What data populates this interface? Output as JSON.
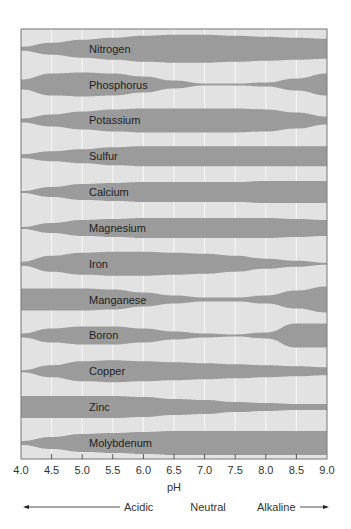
{
  "chart_data": {
    "type": "area",
    "title": "",
    "xlabel": "pH",
    "ylabel": "",
    "xlim": [
      4.0,
      9.0
    ],
    "x_ticks": [
      "4.0",
      "4.5",
      "5.0",
      "5.5",
      "6.0",
      "6.5",
      "7.0",
      "7.5",
      "8.0",
      "8.5",
      "9.0"
    ],
    "grid": true,
    "annotations": {
      "acidic": "Acidic",
      "neutral": "Neutral",
      "alkaline": "Alkaline"
    },
    "colors": {
      "background": "#e2e2e2",
      "band": "#9b9b9b",
      "grid": "#f4f4f4",
      "frame": "#777777"
    },
    "x": [
      4.0,
      4.5,
      5.0,
      5.5,
      6.0,
      6.5,
      7.0,
      7.5,
      8.0,
      8.5,
      9.0
    ],
    "series": [
      {
        "name": "Nitrogen",
        "values": [
          2,
          6,
          9,
          11,
          13,
          14,
          14,
          13,
          12,
          11,
          10
        ]
      },
      {
        "name": "Phosphorus",
        "values": [
          5,
          11,
          12,
          11,
          8,
          4,
          1,
          1,
          2,
          6,
          11
        ]
      },
      {
        "name": "Potassium",
        "values": [
          2,
          6,
          9,
          11,
          12,
          12,
          12,
          12,
          11,
          8,
          4
        ]
      },
      {
        "name": "Sulfur",
        "values": [
          2,
          5,
          7,
          9,
          10,
          10,
          10,
          10,
          10,
          10,
          10
        ]
      },
      {
        "name": "Calcium",
        "values": [
          1,
          5,
          8,
          9,
          10,
          10,
          10,
          10,
          11,
          11,
          11
        ]
      },
      {
        "name": "Magnesium",
        "values": [
          1,
          5,
          8,
          9,
          10,
          10,
          10,
          10,
          10,
          9,
          8
        ]
      },
      {
        "name": "Iron",
        "values": [
          2,
          8,
          11,
          12,
          12,
          11,
          10,
          8,
          5,
          3,
          1
        ]
      },
      {
        "name": "Manganese",
        "values": [
          11,
          11,
          11,
          10,
          7,
          4,
          2,
          2,
          4,
          9,
          13
        ]
      },
      {
        "name": "Boron",
        "values": [
          2,
          7,
          9,
          9,
          7,
          4,
          2,
          1,
          3,
          12,
          12
        ]
      },
      {
        "name": "Copper",
        "values": [
          1,
          6,
          10,
          11,
          10,
          9,
          8,
          7,
          6,
          5,
          4
        ]
      },
      {
        "name": "Zinc",
        "values": [
          11,
          11,
          11,
          11,
          10,
          8,
          7,
          5,
          4,
          3,
          3
        ]
      },
      {
        "name": "Molybdenum",
        "values": [
          2,
          6,
          9,
          10,
          11,
          12,
          12,
          12,
          12,
          12,
          12
        ]
      }
    ]
  }
}
